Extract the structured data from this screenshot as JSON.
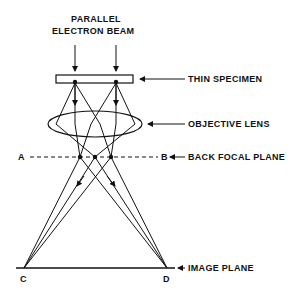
{
  "diagram": {
    "title_line1": "PARALLEL",
    "title_line2": "ELECTRON BEAM",
    "labels": {
      "specimen": "THIN SPECIMEN",
      "lens": "OBJECTIVE LENS",
      "back_focal_plane": "BACK FOCAL PLANE",
      "image_plane": "IMAGE PLANE"
    },
    "points": {
      "A": "A",
      "B": "B",
      "C": "C",
      "D": "D"
    }
  }
}
